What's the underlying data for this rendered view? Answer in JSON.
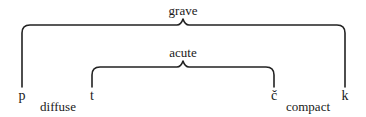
{
  "diagram": {
    "brackets": [
      {
        "id": "grave",
        "label": "grave",
        "spans": [
          "p",
          "k"
        ]
      },
      {
        "id": "acute",
        "label": "acute",
        "spans": [
          "t",
          "č"
        ]
      }
    ],
    "phonemes": [
      {
        "symbol": "p"
      },
      {
        "symbol": "t"
      },
      {
        "symbol": "č"
      },
      {
        "symbol": "k"
      }
    ],
    "axis_labels": {
      "left": "diffuse",
      "right": "compact"
    }
  }
}
